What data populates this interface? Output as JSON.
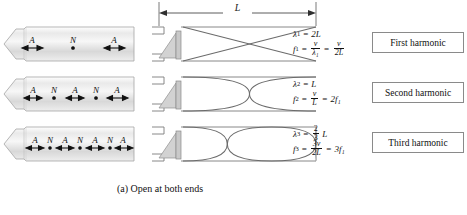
{
  "figure": {
    "caption": "(a) Open at both ends",
    "length_label": "L",
    "rows": [
      {
        "id": "first",
        "markers": [
          "A",
          "N",
          "A"
        ],
        "harmonic_label": "First harmonic",
        "lobes": 1,
        "wavelength": {
          "symbol": "λ",
          "sub": "1",
          "eq": "=",
          "value": "2L"
        },
        "frequency": {
          "symbol": "f",
          "sub": "1",
          "eq": "=",
          "expr1_num": "v",
          "expr1_den": "λ₁",
          "eq2": "=",
          "expr2_num": "v",
          "expr2_den": "2L"
        }
      },
      {
        "id": "second",
        "markers": [
          "A",
          "N",
          "A",
          "N",
          "A"
        ],
        "harmonic_label": "Second harmonic",
        "lobes": 2,
        "wavelength": {
          "symbol": "λ",
          "sub": "2",
          "eq": "=",
          "value": "L"
        },
        "frequency": {
          "symbol": "f",
          "sub": "2",
          "eq": "=",
          "expr1_num": "v",
          "expr1_den": "L",
          "eq2": "=",
          "expr2": "2f₁"
        }
      },
      {
        "id": "third",
        "markers": [
          "A",
          "N",
          "A",
          "N",
          "A",
          "N",
          "A"
        ],
        "harmonic_label": "Third harmonic",
        "lobes": 3,
        "wavelength": {
          "symbol": "λ",
          "sub": "3",
          "eq": "=",
          "frac_num": "2",
          "frac_den": "3",
          "value": "L"
        },
        "frequency": {
          "symbol": "f",
          "sub": "3",
          "eq": "=",
          "expr1_num": "3v",
          "expr1_den": "2L",
          "eq2": "=",
          "expr2": "3f₁"
        }
      }
    ]
  },
  "colors": {
    "wave_stroke": "#6b6b6b",
    "tube_outline": "#9a9a9a",
    "box_border": "#8a8a8a",
    "speaker_fill": "#d2d2d2",
    "text": "#111111"
  }
}
